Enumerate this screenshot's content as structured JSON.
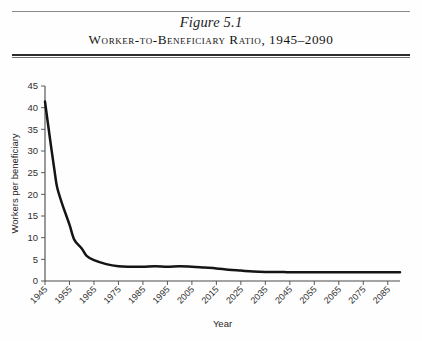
{
  "header": {
    "figure_number": "Figure 5.1",
    "subtitle": "Worker-to-Beneficiary Ratio, 1945–2090"
  },
  "chart_data": {
    "type": "line",
    "title": "Worker-to-Beneficiary Ratio, 1945–2090",
    "xlabel": "Year",
    "ylabel": "Workers per beneficiary",
    "xlim": [
      1945,
      2090
    ],
    "ylim": [
      0,
      45
    ],
    "ytick_step": 5,
    "yticks": [
      0,
      5,
      10,
      15,
      20,
      25,
      30,
      35,
      40,
      45
    ],
    "xticks": [
      1945,
      1955,
      1965,
      1975,
      1985,
      1995,
      2005,
      2015,
      2025,
      2035,
      2045,
      2055,
      2065,
      2075,
      2085
    ],
    "xtick_labels": [
      "1945",
      "1955",
      "1965",
      "1975",
      "1985",
      "1995",
      "2005",
      "2015",
      "2025",
      "2035",
      "2045",
      "2055",
      "2065",
      "2075",
      "2085"
    ],
    "ytick_labels": [
      "0",
      "5",
      "10",
      "15",
      "20",
      "25",
      "30",
      "35",
      "40",
      "45"
    ],
    "grid": false,
    "legend": false,
    "line_color": "#141414",
    "series": [
      {
        "name": "Workers per beneficiary",
        "x": [
          1945,
          1947,
          1949,
          1950,
          1952,
          1955,
          1957,
          1960,
          1962,
          1965,
          1970,
          1975,
          1980,
          1985,
          1990,
          1995,
          2000,
          2005,
          2010,
          2015,
          2020,
          2025,
          2030,
          2035,
          2040,
          2045,
          2050,
          2055,
          2060,
          2065,
          2070,
          2075,
          2080,
          2085,
          2090
        ],
        "values": [
          41.4,
          33.0,
          25.0,
          21.5,
          17.8,
          13.0,
          9.5,
          7.5,
          5.8,
          4.8,
          3.9,
          3.4,
          3.3,
          3.3,
          3.4,
          3.3,
          3.4,
          3.3,
          3.1,
          2.9,
          2.6,
          2.4,
          2.2,
          2.1,
          2.1,
          2.0,
          2.0,
          2.0,
          2.0,
          2.0,
          2.0,
          2.0,
          2.0,
          2.0,
          2.0
        ]
      }
    ]
  },
  "axes": {
    "x_axis_label": "Year",
    "y_axis_label": "Workers per beneficiary"
  }
}
